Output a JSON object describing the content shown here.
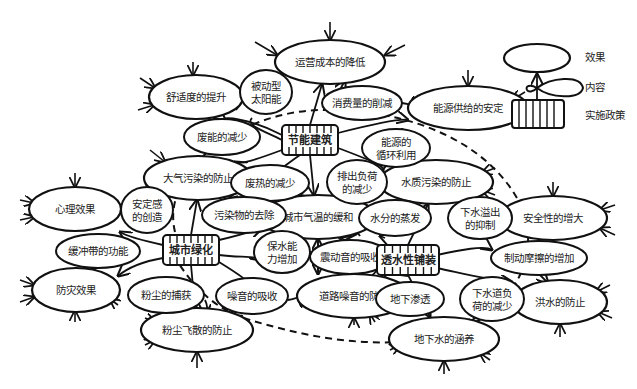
{
  "legend": {
    "effect_label": "效果",
    "content_label": "内容",
    "policy_label": "实施政策"
  },
  "policies": [
    {
      "id": "p_energy",
      "label": "节能建筑",
      "x": 310,
      "y": 140,
      "w": 56,
      "h": 30
    },
    {
      "id": "p_green",
      "label": "城市绿化",
      "x": 191,
      "y": 250,
      "w": 56,
      "h": 30
    },
    {
      "id": "p_permeable",
      "label": "透水性铺装",
      "x": 408,
      "y": 260,
      "w": 62,
      "h": 30
    }
  ],
  "effects": [
    {
      "id": "e_cost",
      "label": "运营成本的降低",
      "x": 330,
      "y": 62,
      "rx": 55,
      "ry": 22
    },
    {
      "id": "e_comfort",
      "label": "舒适度的提升",
      "x": 196,
      "y": 97,
      "rx": 47,
      "ry": 22
    },
    {
      "id": "e_supply",
      "label": "能源供给的安定",
      "x": 468,
      "y": 108,
      "rx": 60,
      "ry": 22
    },
    {
      "id": "e_air",
      "label": "大气污染的防止",
      "x": 198,
      "y": 178,
      "rx": 54,
      "ry": 22
    },
    {
      "id": "e_water",
      "label": "水质污染的防止",
      "x": 436,
      "y": 182,
      "rx": 57,
      "ry": 22
    },
    {
      "id": "e_psych",
      "label": "心理效果",
      "x": 75,
      "y": 209,
      "rx": 46,
      "ry": 22
    },
    {
      "id": "e_climate",
      "label": "城市气温的缓和",
      "x": 318,
      "y": 217,
      "rx": 58,
      "ry": 22
    },
    {
      "id": "e_safety",
      "label": "安全性的增大",
      "x": 553,
      "y": 218,
      "rx": 54,
      "ry": 22
    },
    {
      "id": "e_disaster",
      "label": "防灾效果",
      "x": 76,
      "y": 290,
      "rx": 44,
      "ry": 22
    },
    {
      "id": "e_noise",
      "label": "道路噪音的防止",
      "x": 354,
      "y": 296,
      "rx": 57,
      "ry": 22
    },
    {
      "id": "e_flood",
      "label": "洪水的防止",
      "x": 560,
      "y": 302,
      "rx": 47,
      "ry": 22
    },
    {
      "id": "e_dust",
      "label": "粉尘飞散的防止",
      "x": 197,
      "y": 330,
      "rx": 56,
      "ry": 22
    },
    {
      "id": "e_ground",
      "label": "地下水的涵养",
      "x": 444,
      "y": 339,
      "rx": 55,
      "ry": 22
    }
  ],
  "contents": [
    {
      "id": "c_solar",
      "lines": [
        "被动型",
        "太阳能"
      ],
      "x": 266,
      "y": 92,
      "rx": 26,
      "ry": 22
    },
    {
      "id": "c_consume",
      "lines": [
        "消费量的削减"
      ],
      "x": 362,
      "y": 103,
      "rx": 40,
      "ry": 17
    },
    {
      "id": "c_wasteenergy",
      "lines": [
        "废能的减少"
      ],
      "x": 222,
      "y": 137,
      "rx": 38,
      "ry": 18
    },
    {
      "id": "c_recycle",
      "lines": [
        "能源的",
        "循环利用"
      ],
      "x": 396,
      "y": 148,
      "rx": 34,
      "ry": 19
    },
    {
      "id": "c_wasteheat",
      "lines": [
        "废热的减少"
      ],
      "x": 270,
      "y": 183,
      "rx": 39,
      "ry": 18
    },
    {
      "id": "c_discharge",
      "lines": [
        "排出负荷",
        "的减少"
      ],
      "x": 357,
      "y": 182,
      "rx": 30,
      "ry": 22
    },
    {
      "id": "c_secure",
      "lines": [
        "安定感",
        "的创造"
      ],
      "x": 147,
      "y": 210,
      "rx": 26,
      "ry": 23
    },
    {
      "id": "c_pollutant",
      "lines": [
        "污染物的去除"
      ],
      "x": 244,
      "y": 215,
      "rx": 42,
      "ry": 18
    },
    {
      "id": "c_evap",
      "lines": [
        "水分的蒸发"
      ],
      "x": 395,
      "y": 218,
      "rx": 36,
      "ry": 18
    },
    {
      "id": "c_overflow",
      "lines": [
        "下水溢出",
        "的抑制"
      ],
      "x": 480,
      "y": 218,
      "rx": 32,
      "ry": 21
    },
    {
      "id": "c_buffer",
      "lines": [
        "缓冲带的功能"
      ],
      "x": 98,
      "y": 251,
      "rx": 42,
      "ry": 17
    },
    {
      "id": "c_retain",
      "lines": [
        "保水能",
        "力增加"
      ],
      "x": 282,
      "y": 252,
      "rx": 28,
      "ry": 21
    },
    {
      "id": "c_vibration",
      "lines": [
        "震动音的吸收"
      ],
      "x": 350,
      "y": 257,
      "rx": 40,
      "ry": 17
    },
    {
      "id": "c_brake",
      "lines": [
        "制动摩擦的增加"
      ],
      "x": 539,
      "y": 258,
      "rx": 48,
      "ry": 17
    },
    {
      "id": "c_dustcatch",
      "lines": [
        "粉尘的捕获"
      ],
      "x": 166,
      "y": 295,
      "rx": 38,
      "ry": 18
    },
    {
      "id": "c_noiseabs",
      "lines": [
        "噪音的吸收"
      ],
      "x": 252,
      "y": 296,
      "rx": 36,
      "ry": 18
    },
    {
      "id": "c_infiltrate",
      "lines": [
        "地下渗透"
      ],
      "x": 410,
      "y": 299,
      "rx": 34,
      "ry": 17
    },
    {
      "id": "c_sewer",
      "lines": [
        "下水道负",
        "荷的减少"
      ],
      "x": 492,
      "y": 299,
      "rx": 32,
      "ry": 22
    }
  ]
}
